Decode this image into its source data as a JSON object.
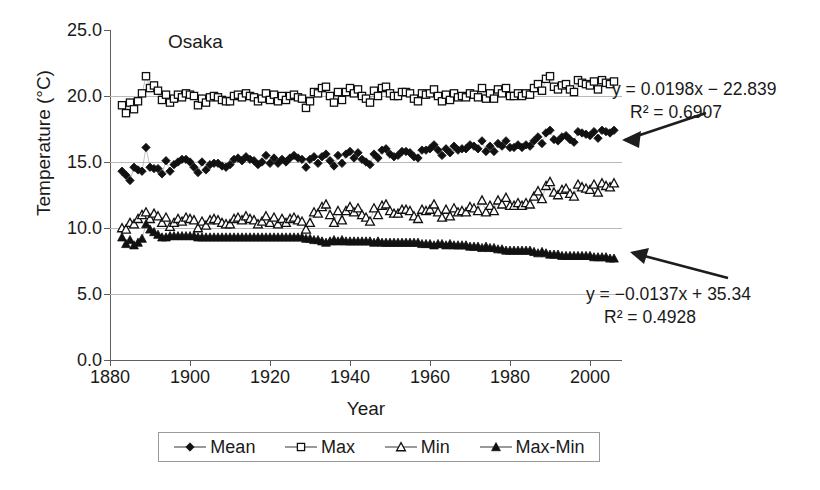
{
  "chart_data": {
    "type": "scatter",
    "title": "Osaka",
    "xlabel": "Year",
    "ylabel": "Temperature (°C)",
    "xlim": [
      1880,
      2008
    ],
    "ylim": [
      0.0,
      25.0
    ],
    "xticks": [
      1880,
      1900,
      1920,
      1940,
      1960,
      1980,
      2000
    ],
    "yticks": [
      "0.0",
      "5.0",
      "10.0",
      "15.0",
      "20.0",
      "25.0"
    ],
    "ytick_values": [
      0,
      5,
      10,
      15,
      20,
      25
    ],
    "grid": "horizontal",
    "legend_position": "bottom",
    "annotations": [
      {
        "name": "mean-trend-equation",
        "equation": "y = 0.0198x − 22.839",
        "r2": "R² = 0.6907",
        "points_to": "Mean"
      },
      {
        "name": "maxmin-trend-equation",
        "equation": "y = −0.0137x + 35.34",
        "r2": "R² = 0.4928",
        "points_to": "Max-Min"
      }
    ],
    "series": [
      {
        "name": "Mean",
        "marker": "diamond-filled",
        "color": "#111111",
        "x": [
          1883,
          1884,
          1885,
          1886,
          1887,
          1888,
          1889,
          1890,
          1891,
          1892,
          1893,
          1894,
          1895,
          1896,
          1897,
          1898,
          1899,
          1900,
          1901,
          1902,
          1903,
          1904,
          1905,
          1906,
          1907,
          1908,
          1909,
          1910,
          1911,
          1912,
          1913,
          1914,
          1915,
          1916,
          1917,
          1918,
          1919,
          1920,
          1921,
          1922,
          1923,
          1924,
          1925,
          1926,
          1927,
          1928,
          1929,
          1930,
          1931,
          1932,
          1933,
          1934,
          1935,
          1936,
          1937,
          1938,
          1939,
          1940,
          1941,
          1942,
          1943,
          1944,
          1945,
          1946,
          1947,
          1948,
          1949,
          1950,
          1951,
          1952,
          1953,
          1954,
          1955,
          1956,
          1957,
          1958,
          1959,
          1960,
          1961,
          1962,
          1963,
          1964,
          1965,
          1966,
          1967,
          1968,
          1969,
          1970,
          1971,
          1972,
          1973,
          1974,
          1975,
          1976,
          1977,
          1978,
          1979,
          1980,
          1981,
          1982,
          1983,
          1984,
          1985,
          1986,
          1987,
          1988,
          1989,
          1990,
          1991,
          1992,
          1993,
          1994,
          1995,
          1996,
          1997,
          1998,
          1999,
          2000,
          2001,
          2002,
          2003,
          2004,
          2005,
          2006
        ],
        "y": [
          14.3,
          14.0,
          13.6,
          14.6,
          14.4,
          14.3,
          16.1,
          14.6,
          14.5,
          14.5,
          14.1,
          15.1,
          14.3,
          14.8,
          15.0,
          15.2,
          15.2,
          15.0,
          14.6,
          14.2,
          15.0,
          14.4,
          14.8,
          14.9,
          14.9,
          14.7,
          14.6,
          14.8,
          15.2,
          15.3,
          15.1,
          15.4,
          15.2,
          15.1,
          14.8,
          15.0,
          15.5,
          14.9,
          15.3,
          14.9,
          15.2,
          15.0,
          15.3,
          15.5,
          15.3,
          15.2,
          14.6,
          15.2,
          15.4,
          14.9,
          15.4,
          15.6,
          15.1,
          14.7,
          15.5,
          14.9,
          15.6,
          15.8,
          15.3,
          15.7,
          15.2,
          15.0,
          14.8,
          15.6,
          15.3,
          15.9,
          16.0,
          15.6,
          15.4,
          15.5,
          15.8,
          15.8,
          15.7,
          15.4,
          15.3,
          15.9,
          15.9,
          16.0,
          16.3,
          15.9,
          15.5,
          16.0,
          15.7,
          16.2,
          15.9,
          16.0,
          16.0,
          16.3,
          16.2,
          16.0,
          16.6,
          15.8,
          16.2,
          15.8,
          16.4,
          16.2,
          16.6,
          16.1,
          16.1,
          16.3,
          16.1,
          16.3,
          16.2,
          16.6,
          16.9,
          16.4,
          17.2,
          17.4,
          16.7,
          16.6,
          16.9,
          17.0,
          16.7,
          16.5,
          17.3,
          17.2,
          17.1,
          17.0,
          17.3,
          16.8,
          17.4,
          17.3,
          17.2,
          17.4
        ]
      },
      {
        "name": "Max",
        "marker": "square-open",
        "color": "#111111",
        "x": [
          1883,
          1884,
          1885,
          1886,
          1887,
          1888,
          1889,
          1890,
          1891,
          1892,
          1893,
          1894,
          1895,
          1896,
          1897,
          1898,
          1899,
          1900,
          1901,
          1902,
          1903,
          1904,
          1905,
          1906,
          1907,
          1908,
          1909,
          1910,
          1911,
          1912,
          1913,
          1914,
          1915,
          1916,
          1917,
          1918,
          1919,
          1920,
          1921,
          1922,
          1923,
          1924,
          1925,
          1926,
          1927,
          1928,
          1929,
          1930,
          1931,
          1932,
          1933,
          1934,
          1935,
          1936,
          1937,
          1938,
          1939,
          1940,
          1941,
          1942,
          1943,
          1944,
          1945,
          1946,
          1947,
          1948,
          1949,
          1950,
          1951,
          1952,
          1953,
          1954,
          1955,
          1956,
          1957,
          1958,
          1959,
          1960,
          1961,
          1962,
          1963,
          1964,
          1965,
          1966,
          1967,
          1968,
          1969,
          1970,
          1971,
          1972,
          1973,
          1974,
          1975,
          1976,
          1977,
          1978,
          1979,
          1980,
          1981,
          1982,
          1983,
          1984,
          1985,
          1986,
          1987,
          1988,
          1989,
          1990,
          1991,
          1992,
          1993,
          1994,
          1995,
          1996,
          1997,
          1998,
          1999,
          2000,
          2001,
          2002,
          2003,
          2004,
          2005,
          2006
        ],
        "y": [
          19.3,
          18.7,
          19.5,
          19.0,
          19.6,
          20.2,
          21.5,
          20.6,
          20.8,
          20.4,
          19.7,
          20.1,
          19.5,
          19.8,
          20.1,
          19.9,
          20.2,
          20.1,
          20.0,
          19.3,
          19.8,
          19.5,
          19.9,
          20.0,
          19.9,
          19.7,
          19.6,
          19.6,
          20.0,
          20.1,
          19.9,
          20.2,
          20.0,
          19.9,
          19.6,
          19.8,
          20.2,
          19.7,
          20.1,
          19.6,
          20.0,
          19.7,
          20.0,
          20.1,
          19.9,
          19.8,
          19.1,
          19.6,
          20.3,
          20.2,
          20.6,
          20.7,
          20.0,
          19.5,
          20.3,
          19.7,
          20.3,
          20.6,
          20.2,
          20.5,
          20.0,
          19.8,
          19.5,
          20.4,
          20.0,
          20.6,
          20.7,
          20.2,
          20.0,
          20.0,
          20.3,
          20.3,
          20.2,
          19.8,
          19.6,
          20.2,
          20.1,
          20.2,
          20.5,
          20.0,
          19.6,
          20.1,
          19.7,
          20.2,
          19.9,
          20.0,
          19.9,
          20.2,
          20.1,
          19.9,
          20.6,
          19.8,
          20.2,
          19.8,
          20.5,
          20.2,
          20.6,
          20.0,
          20.0,
          20.2,
          20.0,
          20.2,
          20.1,
          20.6,
          20.9,
          20.4,
          21.3,
          21.5,
          20.7,
          20.5,
          20.8,
          20.9,
          20.5,
          20.3,
          21.2,
          21.0,
          20.9,
          20.8,
          21.1,
          20.5,
          21.2,
          21.0,
          20.9,
          21.1
        ]
      },
      {
        "name": "Min",
        "marker": "triangle-open",
        "color": "#111111",
        "x": [
          1883,
          1884,
          1885,
          1886,
          1887,
          1888,
          1889,
          1890,
          1891,
          1892,
          1893,
          1894,
          1895,
          1896,
          1897,
          1898,
          1899,
          1900,
          1901,
          1902,
          1903,
          1904,
          1905,
          1906,
          1907,
          1908,
          1909,
          1910,
          1911,
          1912,
          1913,
          1914,
          1915,
          1916,
          1917,
          1918,
          1919,
          1920,
          1921,
          1922,
          1923,
          1924,
          1925,
          1926,
          1927,
          1928,
          1929,
          1930,
          1931,
          1932,
          1933,
          1934,
          1935,
          1936,
          1937,
          1938,
          1939,
          1940,
          1941,
          1942,
          1943,
          1944,
          1945,
          1946,
          1947,
          1948,
          1949,
          1950,
          1951,
          1952,
          1953,
          1954,
          1955,
          1956,
          1957,
          1958,
          1959,
          1960,
          1961,
          1962,
          1963,
          1964,
          1965,
          1966,
          1967,
          1968,
          1969,
          1970,
          1971,
          1972,
          1973,
          1974,
          1975,
          1976,
          1977,
          1978,
          1979,
          1980,
          1981,
          1982,
          1983,
          1984,
          1985,
          1986,
          1987,
          1988,
          1989,
          1990,
          1991,
          1992,
          1993,
          1994,
          1995,
          1996,
          1997,
          1998,
          1999,
          2000,
          2001,
          2002,
          2003,
          2004,
          2005,
          2006
        ],
        "y": [
          10.0,
          9.9,
          10.4,
          10.3,
          10.7,
          11.0,
          11.2,
          10.7,
          11.1,
          10.9,
          10.4,
          10.8,
          10.1,
          10.4,
          10.7,
          10.5,
          10.8,
          10.7,
          10.6,
          10.0,
          10.5,
          10.2,
          10.6,
          10.7,
          10.6,
          10.4,
          10.3,
          10.3,
          10.7,
          10.8,
          10.6,
          10.9,
          10.7,
          10.6,
          10.3,
          10.5,
          10.9,
          10.4,
          10.8,
          10.3,
          10.7,
          10.4,
          10.7,
          10.8,
          10.6,
          10.5,
          9.9,
          10.4,
          11.2,
          11.1,
          11.6,
          11.8,
          11.0,
          10.4,
          11.3,
          10.6,
          11.3,
          11.6,
          11.2,
          11.5,
          11.0,
          10.8,
          10.5,
          11.5,
          11.0,
          11.7,
          11.8,
          11.3,
          11.1,
          11.1,
          11.4,
          11.4,
          11.3,
          10.9,
          10.7,
          11.4,
          11.3,
          11.4,
          11.8,
          11.2,
          10.8,
          11.4,
          10.9,
          11.5,
          11.2,
          11.3,
          11.2,
          11.6,
          11.5,
          11.3,
          12.1,
          11.2,
          11.7,
          11.3,
          12.1,
          11.8,
          12.3,
          11.7,
          11.7,
          11.9,
          11.7,
          11.9,
          11.8,
          12.4,
          12.8,
          12.2,
          13.2,
          13.5,
          12.7,
          12.5,
          12.9,
          13.0,
          12.6,
          12.4,
          13.3,
          13.1,
          13.0,
          12.9,
          13.3,
          12.7,
          13.4,
          13.2,
          13.1,
          13.4
        ]
      },
      {
        "name": "Max-Min",
        "marker": "triangle-filled",
        "color": "#111111",
        "x": [
          1883,
          1884,
          1885,
          1886,
          1887,
          1888,
          1889,
          1890,
          1891,
          1892,
          1893,
          1894,
          1895,
          1896,
          1897,
          1898,
          1899,
          1900,
          1901,
          1902,
          1903,
          1904,
          1905,
          1906,
          1907,
          1908,
          1909,
          1910,
          1911,
          1912,
          1913,
          1914,
          1915,
          1916,
          1917,
          1918,
          1919,
          1920,
          1921,
          1922,
          1923,
          1924,
          1925,
          1926,
          1927,
          1928,
          1929,
          1930,
          1931,
          1932,
          1933,
          1934,
          1935,
          1936,
          1937,
          1938,
          1939,
          1940,
          1941,
          1942,
          1943,
          1944,
          1945,
          1946,
          1947,
          1948,
          1949,
          1950,
          1951,
          1952,
          1953,
          1954,
          1955,
          1956,
          1957,
          1958,
          1959,
          1960,
          1961,
          1962,
          1963,
          1964,
          1965,
          1966,
          1967,
          1968,
          1969,
          1970,
          1971,
          1972,
          1973,
          1974,
          1975,
          1976,
          1977,
          1978,
          1979,
          1980,
          1981,
          1982,
          1983,
          1984,
          1985,
          1986,
          1987,
          1988,
          1989,
          1990,
          1991,
          1992,
          1993,
          1994,
          1995,
          1996,
          1997,
          1998,
          1999,
          2000,
          2001,
          2002,
          2003,
          2004,
          2005,
          2006
        ],
        "y": [
          9.3,
          8.8,
          9.1,
          8.7,
          8.9,
          9.2,
          10.3,
          9.9,
          9.7,
          9.5,
          9.3,
          9.3,
          9.4,
          9.4,
          9.4,
          9.4,
          9.4,
          9.4,
          9.4,
          9.3,
          9.3,
          9.3,
          9.3,
          9.3,
          9.3,
          9.3,
          9.3,
          9.3,
          9.3,
          9.3,
          9.3,
          9.3,
          9.3,
          9.3,
          9.3,
          9.3,
          9.3,
          9.3,
          9.3,
          9.3,
          9.3,
          9.3,
          9.3,
          9.3,
          9.3,
          9.3,
          9.2,
          9.2,
          9.1,
          9.1,
          9.0,
          8.9,
          9.0,
          9.1,
          9.0,
          9.1,
          9.0,
          9.0,
          9.0,
          9.0,
          9.0,
          9.0,
          9.0,
          8.9,
          9.0,
          8.9,
          8.9,
          8.9,
          8.9,
          8.9,
          8.9,
          8.9,
          8.9,
          8.9,
          8.9,
          8.8,
          8.8,
          8.8,
          8.7,
          8.8,
          8.8,
          8.7,
          8.8,
          8.7,
          8.7,
          8.7,
          8.7,
          8.6,
          8.6,
          8.6,
          8.5,
          8.6,
          8.5,
          8.5,
          8.4,
          8.4,
          8.3,
          8.3,
          8.3,
          8.3,
          8.3,
          8.3,
          8.3,
          8.2,
          8.1,
          8.2,
          8.1,
          8.0,
          8.0,
          8.0,
          7.9,
          7.9,
          7.9,
          7.9,
          7.9,
          7.9,
          7.9,
          7.9,
          7.8,
          7.8,
          7.8,
          7.8,
          7.7,
          7.7
        ]
      }
    ],
    "legend": [
      {
        "label": "Mean",
        "marker": "diamond-filled"
      },
      {
        "label": "Max",
        "marker": "square-open"
      },
      {
        "label": "Min",
        "marker": "triangle-open"
      },
      {
        "label": "Max-Min",
        "marker": "triangle-filled"
      }
    ]
  }
}
